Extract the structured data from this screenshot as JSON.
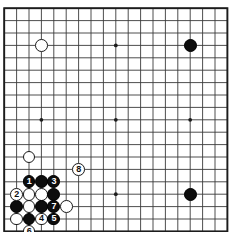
{
  "diagram": {
    "kind": "go-board-diagram",
    "board_size": 19,
    "grid": {
      "origin_x": 4.2,
      "origin_y": 8.2,
      "spacing": 12.4,
      "line_color": "#3a3a3a",
      "border_color": "#1c1c1c",
      "background_color": "#ffffff",
      "line_width": 0.9,
      "border_width": 1.9
    },
    "star_points": [
      {
        "col": 3,
        "row": 3
      },
      {
        "col": 9,
        "row": 3
      },
      {
        "col": 15,
        "row": 3
      },
      {
        "col": 3,
        "row": 9
      },
      {
        "col": 9,
        "row": 9
      },
      {
        "col": 15,
        "row": 9
      },
      {
        "col": 3,
        "row": 15
      },
      {
        "col": 9,
        "row": 15
      },
      {
        "col": 15,
        "row": 15
      }
    ],
    "star_point_radius": 1.9,
    "stone_radius": 6.4,
    "colors": {
      "black_stone": "#0d0d0d",
      "white_stone": "#ffffff",
      "stone_outline": "#1a1a1a",
      "label_on_black": "#ffffff",
      "label_on_white": "#111111"
    },
    "stones": [
      {
        "id": "w-d16",
        "color": "white",
        "col": 3,
        "row": 3,
        "label": ""
      },
      {
        "id": "b-q16",
        "color": "black",
        "col": 15,
        "row": 3,
        "label": ""
      },
      {
        "id": "b-q4",
        "color": "black",
        "col": 15,
        "row": 15,
        "label": ""
      },
      {
        "id": "w-c8",
        "color": "white",
        "col": 2,
        "row": 12,
        "label": ""
      },
      {
        "id": "b-move1",
        "color": "black",
        "col": 2,
        "row": 14,
        "label": "1"
      },
      {
        "id": "b-c6",
        "color": "black",
        "col": 3,
        "row": 14,
        "label": ""
      },
      {
        "id": "b-move3",
        "color": "black",
        "col": 4,
        "row": 14,
        "label": "3"
      },
      {
        "id": "w-move2",
        "color": "white",
        "col": 1,
        "row": 15,
        "label": "2"
      },
      {
        "id": "w-c5",
        "color": "white",
        "col": 2,
        "row": 15,
        "label": ""
      },
      {
        "id": "w-d5",
        "color": "white",
        "col": 3,
        "row": 15,
        "label": ""
      },
      {
        "id": "b-e5",
        "color": "black",
        "col": 4,
        "row": 15,
        "label": ""
      },
      {
        "id": "b-b4",
        "color": "black",
        "col": 1,
        "row": 16,
        "label": ""
      },
      {
        "id": "w-c4",
        "color": "white",
        "col": 2,
        "row": 16,
        "label": ""
      },
      {
        "id": "b-d4",
        "color": "black",
        "col": 3,
        "row": 16,
        "label": ""
      },
      {
        "id": "b-move7",
        "color": "black",
        "col": 4,
        "row": 16,
        "label": "7"
      },
      {
        "id": "w-f4",
        "color": "white",
        "col": 5,
        "row": 16,
        "label": ""
      },
      {
        "id": "w-b3",
        "color": "white",
        "col": 1,
        "row": 17,
        "label": ""
      },
      {
        "id": "b-c3",
        "color": "black",
        "col": 2,
        "row": 17,
        "label": ""
      },
      {
        "id": "w-move4",
        "color": "white",
        "col": 3,
        "row": 17,
        "label": "4"
      },
      {
        "id": "b-move5",
        "color": "black",
        "col": 4,
        "row": 17,
        "label": "5"
      },
      {
        "id": "w-move6",
        "color": "white",
        "col": 2,
        "row": 18,
        "label": "6"
      },
      {
        "id": "w-move8",
        "color": "white",
        "col": 6,
        "row": 13,
        "label": "8"
      }
    ],
    "move_sequence": [
      {
        "move": 1,
        "color": "black"
      },
      {
        "move": 2,
        "color": "white"
      },
      {
        "move": 3,
        "color": "black"
      },
      {
        "move": 4,
        "color": "white"
      },
      {
        "move": 5,
        "color": "black"
      },
      {
        "move": 6,
        "color": "white"
      },
      {
        "move": 7,
        "color": "black"
      },
      {
        "move": 8,
        "color": "white"
      }
    ]
  }
}
